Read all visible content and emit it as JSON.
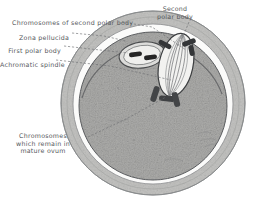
{
  "figure": {
    "background_color": "#ffffff",
    "text_color": "#55585c"
  },
  "labels": [
    {
      "id": "chromosomes-second-polar-body",
      "text": "Chromosomes of second polar body",
      "align": "left",
      "x": 12,
      "y": 19
    },
    {
      "id": "zona-pellucida",
      "text": "Zona pellucida",
      "align": "right",
      "x": 69,
      "y": 34
    },
    {
      "id": "first-polar-body",
      "text": "First polar body",
      "align": "right",
      "x": 61,
      "y": 47
    },
    {
      "id": "achromatic-spindle",
      "text": "Achromatic spindle",
      "align": "right",
      "x": 53,
      "y": 61
    },
    {
      "id": "second-polar-body",
      "text": "Second\npolar body",
      "align": "center",
      "x": 175,
      "y": 5
    },
    {
      "id": "chromosomes-mature-ovum",
      "text": "Chromosomes\nwhich remain in\nmature ovum",
      "align": "center",
      "x": 28,
      "y": 132
    }
  ],
  "structures": {
    "zona_pellucida": {
      "name": "Zona pellucida",
      "fill": "#b8b8b6",
      "stroke": "#6f7173",
      "center_x": 153,
      "center_y": 103,
      "outer_radius": 92,
      "inner_radius": 80
    },
    "perivitelline_space": {
      "name": "Perivitelline space",
      "fill": "#fdfdfd",
      "stroke": "#8a8c8e",
      "radius": 80
    },
    "ovum_cytoplasm": {
      "name": "Mature ovum cytoplasm",
      "fill": "#a8a8a6",
      "stroke": "#5e6063",
      "center_x": 153,
      "center_y": 106,
      "radius": 74
    },
    "first_polar_body": {
      "name": "First polar body",
      "fill": "#d9d9d7",
      "stroke": "#4a4c4e",
      "center_x": 142,
      "center_y": 55,
      "rx": 23,
      "ry": 13,
      "rotation": -8,
      "chromosome_count": 2,
      "chromosome_fill": "#2b2b2b"
    },
    "second_polar_body": {
      "name": "Second polar body",
      "fill": "#f0f0ee",
      "stroke": "#3c3e40",
      "center_x": 176,
      "center_y": 65,
      "rx": 17,
      "ry": 32,
      "rotation": 12,
      "striation_count": 7,
      "chromosome_fill": "#3a3a3a"
    },
    "ovum_chromosomes": {
      "name": "Chromosomes which remain in mature ovum",
      "fill": "#3f4143",
      "count": 3,
      "center_x": 168,
      "center_y": 98
    },
    "achromatic_spindle": {
      "name": "Achromatic spindle",
      "stroke": "#4f5153"
    }
  },
  "leaders": {
    "stroke": "#6e7072",
    "style": "dashed",
    "lines": [
      {
        "id": "leader-chromosomes-second-polar-body",
        "from": [
          122,
          22
        ],
        "to": [
          186,
          50
        ]
      },
      {
        "id": "leader-zona-pellucida",
        "from": [
          72,
          33
        ],
        "to": [
          125,
          40
        ]
      },
      {
        "id": "leader-first-polar-body",
        "from": [
          64,
          46
        ],
        "to": [
          130,
          52
        ]
      },
      {
        "id": "leader-achromatic-spindle",
        "from": [
          56,
          60
        ],
        "to": [
          172,
          80
        ]
      },
      {
        "id": "leader-second-polar-body",
        "from": [
          189,
          22
        ],
        "to": [
          178,
          46
        ]
      },
      {
        "id": "leader-chromosomes-mature-ovum",
        "from": [
          88,
          137
        ],
        "to": [
          168,
          96
        ]
      }
    ]
  }
}
